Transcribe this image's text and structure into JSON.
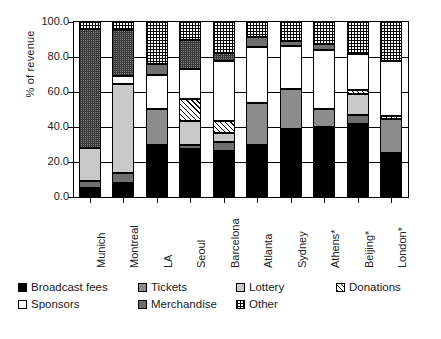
{
  "chart_data": {
    "type": "bar",
    "subtype": "stacked-bar-100-percent",
    "title": "",
    "xlabel": "",
    "ylabel": "% of revenue",
    "ylim": [
      0,
      100
    ],
    "yticks": [
      "0.0",
      "20.0",
      "40.0",
      "60.0",
      "80.0",
      "100.0"
    ],
    "ytick_values": [
      0,
      20,
      40,
      60,
      80,
      100
    ],
    "grid": true,
    "legend_position": "bottom-left",
    "categories": [
      "Munich",
      "Montreal",
      "LA",
      "Seoul",
      "Barcelona",
      "Atlanta",
      "Sydney",
      "Athens*",
      "Beijing*",
      "London*"
    ],
    "series": [
      {
        "name": "Broadcast fees",
        "key": "broadcast",
        "fill": "#000000",
        "pattern": "solid-black",
        "values": [
          5.0,
          8.0,
          30.0,
          27.5,
          26.5,
          30.0,
          39.0,
          40.0,
          41.5,
          25.0
        ]
      },
      {
        "name": "Tickets",
        "key": "tickets",
        "fill": "#8c8c8c",
        "pattern": "solid-gray",
        "values": [
          0.0,
          0.0,
          20.5,
          0.0,
          0.0,
          24.0,
          22.5,
          10.5,
          0.0,
          19.5
        ]
      },
      {
        "name": "Lottery",
        "key": "lottery",
        "fill": "#c9c9c9",
        "pattern": "solid-light-gray",
        "values": [
          19.0,
          50.5,
          0.0,
          13.5,
          5.0,
          0.0,
          0.0,
          0.0,
          12.0,
          0.0
        ]
      },
      {
        "name": "Donations",
        "key": "donations",
        "fill": "#ffffff",
        "pattern": "diagonal-hatch",
        "values": [
          0.0,
          0.0,
          0.0,
          12.5,
          7.0,
          0.0,
          0.0,
          0.0,
          2.0,
          2.0
        ]
      },
      {
        "name": "Sponsors",
        "key": "sponsors",
        "fill": "#ffffff",
        "pattern": "solid-white",
        "values": [
          0.0,
          4.5,
          19.5,
          17.0,
          34.0,
          32.0,
          25.0,
          33.5,
          20.5,
          31.5
        ]
      },
      {
        "name": "Merchandise",
        "key": "merchandise",
        "fill": "#6f6f6f",
        "pattern": "solid-dark-gray",
        "values": [
          4.0,
          6.0,
          6.0,
          9.5,
          10.0,
          5.5,
          2.5,
          3.5,
          6.5,
          0.0
        ]
      },
      {
        "name": "Other",
        "key": "other",
        "fill": "#ffffff",
        "pattern": "checkerboard-dots",
        "values": [
          72.0,
          31.0,
          24.0,
          20.0,
          17.0,
          8.5,
          11.0,
          12.5,
          17.5,
          22.0
        ]
      }
    ],
    "stacks": [
      {
        "category": "Munich",
        "segments": [
          {
            "key": "broadcast",
            "label": "Broadcast fees",
            "value": 5.0
          },
          {
            "key": "merchandise",
            "label": "Merchandise",
            "value": 4.0
          },
          {
            "key": "lottery",
            "label": "Lottery",
            "value": 19.0
          },
          {
            "key": "other-dark",
            "label": "Other",
            "value": 68.0
          },
          {
            "key": "other",
            "label": "Other",
            "value": 4.0
          }
        ]
      },
      {
        "category": "Montreal",
        "segments": [
          {
            "key": "broadcast",
            "label": "Broadcast fees",
            "value": 8.0
          },
          {
            "key": "merchandise",
            "label": "Merchandise",
            "value": 6.0
          },
          {
            "key": "lottery",
            "label": "Lottery",
            "value": 50.5
          },
          {
            "key": "sponsors",
            "label": "Sponsors",
            "value": 4.5
          },
          {
            "key": "other-dark",
            "label": "Other",
            "value": 26.5
          },
          {
            "key": "other",
            "label": "Other",
            "value": 4.5
          }
        ]
      },
      {
        "category": "LA",
        "segments": [
          {
            "key": "broadcast",
            "label": "Broadcast fees",
            "value": 30.0
          },
          {
            "key": "tickets",
            "label": "Tickets",
            "value": 20.5
          },
          {
            "key": "sponsors",
            "label": "Sponsors",
            "value": 19.5
          },
          {
            "key": "merchandise",
            "label": "Merchandise",
            "value": 6.0
          },
          {
            "key": "other",
            "label": "Other",
            "value": 24.0
          }
        ]
      },
      {
        "category": "Seoul",
        "segments": [
          {
            "key": "broadcast",
            "label": "Broadcast fees",
            "value": 27.5
          },
          {
            "key": "merchandise",
            "label": "Merchandise",
            "value": 2.5
          },
          {
            "key": "lottery",
            "label": "Lottery",
            "value": 13.5
          },
          {
            "key": "donations",
            "label": "Donations",
            "value": 12.5
          },
          {
            "key": "sponsors",
            "label": "Sponsors",
            "value": 17.0
          },
          {
            "key": "other-dark",
            "label": "Other",
            "value": 17.0
          },
          {
            "key": "other",
            "label": "Other",
            "value": 10.0
          }
        ]
      },
      {
        "category": "Barcelona",
        "segments": [
          {
            "key": "broadcast",
            "label": "Broadcast fees",
            "value": 26.5
          },
          {
            "key": "merchandise",
            "label": "Merchandise",
            "value": 5.0
          },
          {
            "key": "lottery",
            "label": "Lottery",
            "value": 5.0
          },
          {
            "key": "donations",
            "label": "Donations",
            "value": 7.0
          },
          {
            "key": "sponsors",
            "label": "Sponsors",
            "value": 34.0
          },
          {
            "key": "other-dark",
            "label": "Other",
            "value": 5.0
          },
          {
            "key": "other",
            "label": "Other",
            "value": 17.5
          }
        ]
      },
      {
        "category": "Atlanta",
        "segments": [
          {
            "key": "broadcast",
            "label": "Broadcast fees",
            "value": 30.0
          },
          {
            "key": "tickets",
            "label": "Tickets",
            "value": 24.0
          },
          {
            "key": "sponsors",
            "label": "Sponsors",
            "value": 32.0
          },
          {
            "key": "merchandise",
            "label": "Merchandise",
            "value": 5.5
          },
          {
            "key": "other",
            "label": "Other",
            "value": 8.5
          }
        ]
      },
      {
        "category": "Sydney",
        "segments": [
          {
            "key": "broadcast",
            "label": "Broadcast fees",
            "value": 39.0
          },
          {
            "key": "tickets",
            "label": "Tickets",
            "value": 22.5
          },
          {
            "key": "sponsors",
            "label": "Sponsors",
            "value": 25.0
          },
          {
            "key": "merchandise",
            "label": "Merchandise",
            "value": 2.5
          },
          {
            "key": "other",
            "label": "Other",
            "value": 11.0
          }
        ]
      },
      {
        "category": "Athens*",
        "segments": [
          {
            "key": "broadcast",
            "label": "Broadcast fees",
            "value": 40.0
          },
          {
            "key": "tickets",
            "label": "Tickets",
            "value": 10.5
          },
          {
            "key": "sponsors",
            "label": "Sponsors",
            "value": 33.5
          },
          {
            "key": "merchandise",
            "label": "Merchandise",
            "value": 3.5
          },
          {
            "key": "other",
            "label": "Other",
            "value": 12.5
          }
        ]
      },
      {
        "category": "Beijing*",
        "segments": [
          {
            "key": "broadcast",
            "label": "Broadcast fees",
            "value": 41.5
          },
          {
            "key": "merchandise",
            "label": "Merchandise",
            "value": 5.5
          },
          {
            "key": "lottery",
            "label": "Lottery",
            "value": 12.0
          },
          {
            "key": "donations",
            "label": "Donations",
            "value": 2.0
          },
          {
            "key": "sponsors",
            "label": "Sponsors",
            "value": 20.5
          },
          {
            "key": "merchandise",
            "label": "Merchandise",
            "value": 1.0
          },
          {
            "key": "other",
            "label": "Other",
            "value": 17.5
          }
        ]
      },
      {
        "category": "London*",
        "segments": [
          {
            "key": "broadcast",
            "label": "Broadcast fees",
            "value": 25.0
          },
          {
            "key": "tickets",
            "label": "Tickets",
            "value": 19.5
          },
          {
            "key": "donations",
            "label": "Donations",
            "value": 2.0
          },
          {
            "key": "sponsors",
            "label": "Sponsors",
            "value": 31.5
          },
          {
            "key": "other",
            "label": "Other",
            "value": 22.0
          }
        ]
      }
    ]
  },
  "legend": {
    "row1": [
      {
        "label": "Broadcast fees",
        "key": "broadcast"
      },
      {
        "label": "Tickets",
        "key": "tickets"
      },
      {
        "label": "Lottery",
        "key": "lottery"
      },
      {
        "label": "Donations",
        "key": "donations"
      }
    ],
    "row2": [
      {
        "label": "Sponsors",
        "key": "sponsors"
      },
      {
        "label": "Merchandise",
        "key": "merchandise"
      },
      {
        "label": "Other",
        "key": "other"
      }
    ]
  }
}
